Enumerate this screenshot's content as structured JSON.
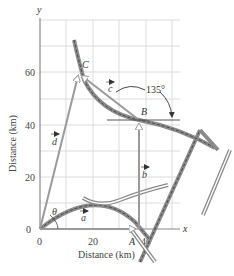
{
  "diagram": {
    "axes": {
      "x_letter": "x",
      "y_letter": "y",
      "x_title": "Distance (km)",
      "y_title": "Distance (km)",
      "x_ticks": [
        "0",
        "20",
        "40"
      ],
      "y_ticks": [
        "0",
        "20",
        "40",
        "60"
      ]
    },
    "points": {
      "A": "A",
      "B": "B",
      "C": "C"
    },
    "vectors": {
      "a": "a",
      "b": "b",
      "c": "c",
      "d": "d"
    },
    "angles": {
      "theta": "θ",
      "bc": "135°"
    },
    "colors": {
      "grid": "#d9d9d9",
      "axis": "#888888",
      "vector": "#9a9a9a",
      "road": "#8a8a8a",
      "road_dash": "#444444"
    }
  }
}
